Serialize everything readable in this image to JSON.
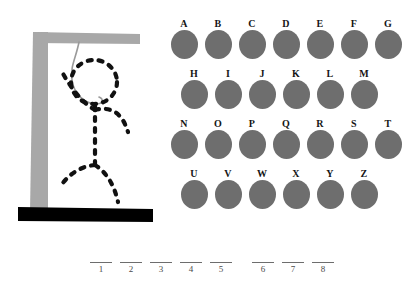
{
  "puzzle": {
    "title": "hangman-puzzle",
    "gallows": {
      "post_color": "#a8a8a8",
      "beam_color": "#a8a8a8",
      "base_color": "#000000",
      "rope_color": "#9a9a9a",
      "figure_color": "#111111"
    },
    "figure_parts": [
      "head",
      "torso",
      "left-arm",
      "right-arm",
      "left-leg",
      "right-leg"
    ]
  },
  "alphabet": {
    "disc_color": "#6e6e6e",
    "rows": [
      {
        "letters": [
          "A",
          "B",
          "C",
          "D",
          "E",
          "F",
          "G"
        ]
      },
      {
        "letters": [
          "H",
          "I",
          "J",
          "K",
          "L",
          "M"
        ]
      },
      {
        "letters": [
          "N",
          "O",
          "P",
          "Q",
          "R",
          "S",
          "T"
        ]
      },
      {
        "letters": [
          "U",
          "V",
          "W",
          "X",
          "Y",
          "Z"
        ]
      }
    ]
  },
  "answer": {
    "line_color": "#6d6d6d",
    "groups": [
      {
        "numbers": [
          "1",
          "2",
          "3",
          "4",
          "5"
        ],
        "values": [
          "",
          "",
          "",
          "",
          ""
        ]
      },
      {
        "numbers": [
          "6",
          "7",
          "8"
        ],
        "values": [
          "",
          "",
          ""
        ]
      }
    ]
  }
}
